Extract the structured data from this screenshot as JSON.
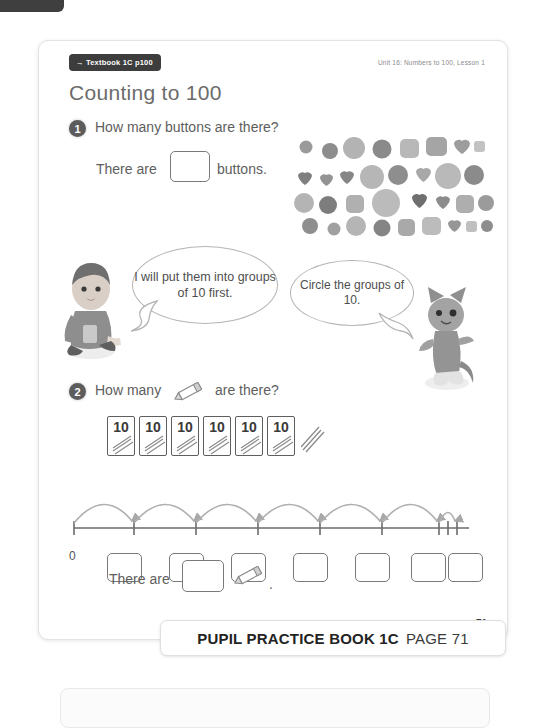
{
  "page": {
    "textbook_tag": "→ Textbook 1C p100",
    "unit_label": "Unit 16: Numbers to 100, Lesson 1",
    "title": "Counting to 100",
    "page_number": "71"
  },
  "question1": {
    "number": "1",
    "prompt": "How many buttons are there?",
    "answer_prefix": "There are",
    "answer_value": "",
    "answer_suffix": "buttons."
  },
  "speech": {
    "boy": "I will put them into groups of 10 first.",
    "cat": "Circle the groups of 10."
  },
  "question2": {
    "number": "2",
    "prompt_before": "How many",
    "prompt_after": "are there?",
    "pencil_icon": "pencil-icon",
    "ten_cards": [
      "10",
      "10",
      "10",
      "10",
      "10",
      "10"
    ],
    "loose_pencils": 3,
    "answer_prefix": "There are",
    "answer_value": "",
    "answer_period": ".",
    "number_line": {
      "start_label": "0",
      "big_jumps": 6,
      "small_jumps": 3,
      "answer_boxes": 7
    }
  },
  "banner": {
    "book": "PUPIL PRACTICE BOOK 1C",
    "page": "PAGE 71"
  },
  "buttons_illustration": {
    "icon": "buttons-cluster",
    "count_rows": 4
  },
  "characters": {
    "boy": "boy-character",
    "cat": "cat-character"
  },
  "colors": {
    "tag_bg": "#3d3d3d",
    "title_text": "#6b6b6b",
    "body_text": "#5e5e5e",
    "outline": "#7a7a7a"
  }
}
